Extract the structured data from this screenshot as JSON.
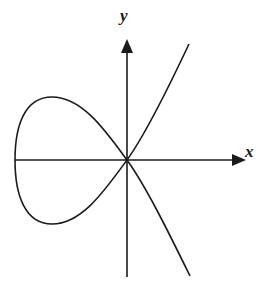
{
  "diagram": {
    "type": "strophoid-curve",
    "axes": {
      "x_label": "x",
      "y_label": "y"
    },
    "colors": {
      "stroke": "#1a1a1a",
      "background": "#ffffff"
    },
    "elements": [
      "x-axis with arrowhead",
      "y-axis with arrowhead",
      "loop on left of origin",
      "two branches crossing at origin"
    ]
  }
}
